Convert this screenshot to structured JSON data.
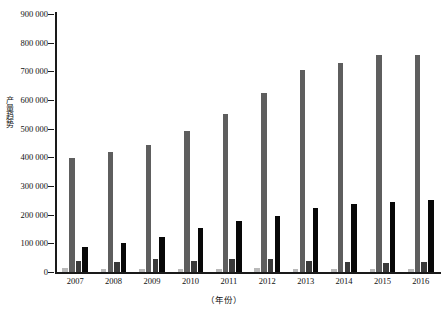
{
  "chart_data": {
    "type": "bar",
    "title": "",
    "xlabel": "（年份）",
    "ylabel": "产量趋势",
    "categories": [
      "2007",
      "2008",
      "2009",
      "2010",
      "2011",
      "2012",
      "2013",
      "2014",
      "2015",
      "2016"
    ],
    "ylim": [
      0,
      900000
    ],
    "ytick_labels": [
      "900 000",
      "800 000",
      "700 000",
      "600 000",
      "500 000",
      "400 000",
      "300 000",
      "200 000",
      "100 000",
      "0"
    ],
    "ytick_values": [
      900000,
      800000,
      700000,
      600000,
      500000,
      400000,
      300000,
      200000,
      100000,
      0
    ],
    "grid": false,
    "legend": "none",
    "series": [
      {
        "name": "series-1",
        "color": "#b9b9b9",
        "values": [
          14000,
          12000,
          11000,
          10000,
          11000,
          13000,
          12000,
          11000,
          10000,
          11000
        ]
      },
      {
        "name": "series-2",
        "color": "#5e5e5e",
        "values": [
          397000,
          417000,
          443000,
          492000,
          551000,
          625000,
          703000,
          729000,
          757000,
          757000
        ]
      },
      {
        "name": "series-3",
        "color": "#3a3a3a",
        "values": [
          39000,
          36000,
          46000,
          38000,
          47000,
          47000,
          40000,
          35000,
          33000,
          34000
        ]
      },
      {
        "name": "series-4",
        "color": "#080808",
        "values": [
          87000,
          101000,
          121000,
          152000,
          178000,
          196000,
          224000,
          238000,
          243000,
          252000
        ]
      }
    ]
  },
  "axis": {
    "y_title": "产量趋势",
    "x_title": "（年份）"
  }
}
